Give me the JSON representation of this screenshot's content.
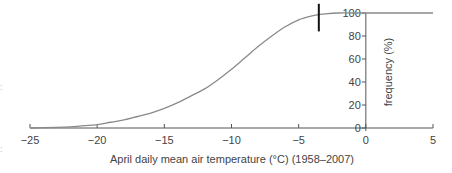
{
  "chart_data": {
    "type": "line",
    "title": "",
    "xlabel": "April daily mean air temperature (°C) (1958–2007)",
    "ylabel": "frequency (%)",
    "xlim": [
      -25,
      5
    ],
    "ylim": [
      0,
      100
    ],
    "x_ticks": [
      -25,
      -20,
      -15,
      -10,
      -5,
      0,
      5
    ],
    "x_tick_labels": [
      "−25",
      "−20",
      "−15",
      "−10",
      "−5",
      "0",
      "5"
    ],
    "y_ticks": [
      0,
      20,
      40,
      60,
      80,
      100
    ],
    "y_tick_labels": [
      "0",
      "20",
      "40",
      "60",
      "80",
      "100"
    ],
    "y_axis_position_x": 0,
    "grid": false,
    "legend": null,
    "series": [
      {
        "name": "cumulative frequency",
        "color": "#8a8a8a",
        "x": [
          -25,
          -23,
          -22,
          -21,
          -20,
          -19,
          -18,
          -17,
          -16,
          -15,
          -14,
          -13,
          -12,
          -11,
          -10,
          -9,
          -8,
          -7,
          -6,
          -5,
          -4,
          -3.5,
          -3,
          -2,
          -1,
          0,
          5
        ],
        "y": [
          0,
          0.5,
          1,
          2,
          3,
          5,
          7,
          10,
          13,
          17,
          22,
          28,
          34,
          42,
          51,
          61,
          71,
          80,
          88,
          94,
          97.5,
          98.5,
          99.3,
          100,
          100,
          100,
          100
        ]
      }
    ],
    "annotations": [
      {
        "type": "vertical-marker",
        "x": -3.5,
        "y_from": 84,
        "y_to": 108,
        "color": "#111111"
      }
    ]
  }
}
